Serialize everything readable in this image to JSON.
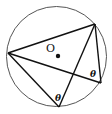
{
  "diagram": {
    "type": "inscribed-angles-in-circle",
    "circle": {
      "cx": 56.5,
      "cy": 56.5,
      "r": 50,
      "stroke": "#555555"
    },
    "center": {
      "label": "O",
      "label_x": 46,
      "label_y": 52,
      "dot_x": 58,
      "dot_y": 56
    },
    "vertices": {
      "A": {
        "x": 8,
        "y": 53
      },
      "B": {
        "x": 95,
        "y": 24
      },
      "C": {
        "x": 101,
        "y": 83
      },
      "D": {
        "x": 59,
        "y": 107
      }
    },
    "segments": [
      {
        "from": "A",
        "to": "B"
      },
      {
        "from": "A",
        "to": "C"
      },
      {
        "from": "A",
        "to": "D"
      },
      {
        "from": "B",
        "to": "C"
      },
      {
        "from": "B",
        "to": "D"
      }
    ],
    "angle_labels": [
      {
        "text": "θ",
        "x": 90,
        "y": 77
      },
      {
        "text": "θ",
        "x": 55,
        "y": 101
      }
    ],
    "line_color": "#111111"
  }
}
